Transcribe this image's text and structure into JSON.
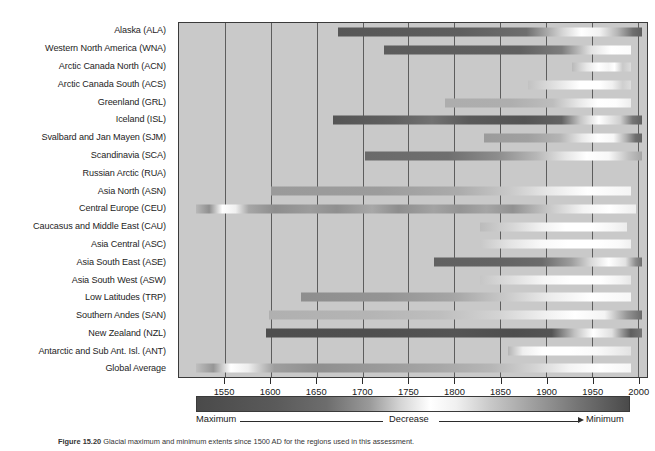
{
  "figure": {
    "caption_number": "Figure 15.20",
    "caption_text": "Glacial maximum and minimum extents since 1500 AD for the regions used in this assessment."
  },
  "axis": {
    "tick_labels": [
      "1550",
      "1600",
      "1650",
      "1700",
      "1750",
      "1800",
      "1850",
      "1900",
      "1950",
      "2000"
    ],
    "xlim_min": 1500,
    "xlim_max": 2010
  },
  "legend": {
    "left_label": "Maximum",
    "middle_label": "Decrease",
    "right_label": "Minimum",
    "color_dark": "#4a4a4a",
    "color_light": "#ffffff"
  },
  "chart_data": {
    "type": "heatmap",
    "title": "",
    "xlabel": "",
    "ylabel": "",
    "xlim": [
      1500,
      2010
    ],
    "grid": true,
    "legend_position": "below",
    "colormap_note": "dark = glacial maximum, white = decrease, dark = minimum",
    "categories": [
      "Alaska (ALA)",
      "Western North America (WNA)",
      "Arctic Canada North (ACN)",
      "Arctic Canada South (ACS)",
      "Greenland (GRL)",
      "Iceland (ISL)",
      "Svalbard and Jan Mayen (SJM)",
      "Scandinavia (SCA)",
      "Russian Arctic (RUA)",
      "Asia North (ASN)",
      "Central Europe (CEU)",
      "Caucasus and Middle East (CAU)",
      "Asia Central (ASC)",
      "Asia South East (ASE)",
      "Asia South West (ASW)",
      "Low Latitudes (TRP)",
      "Southern Andes (SAN)",
      "New Zealand (NZL)",
      "Antarctic and Sub Ant. Isl. (ANT)",
      "Global Average"
    ],
    "series": [
      {
        "region": "Alaska (ALA)",
        "start": 1673,
        "end": 2005,
        "stops": [
          [
            0,
            "#575757"
          ],
          [
            40,
            "#5e5e5e"
          ],
          [
            62,
            "#6e6e6e"
          ],
          [
            74,
            "#d6d6d6"
          ],
          [
            80,
            "#ffffff"
          ],
          [
            86,
            "#f2f2f2"
          ],
          [
            92,
            "#b5b5b5"
          ],
          [
            97,
            "#6f6f6f"
          ],
          [
            100,
            "#5e5e5e"
          ]
        ]
      },
      {
        "region": "Western North America (WNA)",
        "start": 1723,
        "end": 1993,
        "stops": [
          [
            0,
            "#5c5c5c"
          ],
          [
            55,
            "#606060"
          ],
          [
            72,
            "#7d7d7d"
          ],
          [
            84,
            "#e4e4e4"
          ],
          [
            92,
            "#ffffff"
          ],
          [
            100,
            "#fbfbfb"
          ]
        ]
      },
      {
        "region": "Arctic Canada North (ACN)",
        "start": 1928,
        "end": 1993,
        "stops": [
          [
            0,
            "#b9b9b9"
          ],
          [
            25,
            "#e8e8e8"
          ],
          [
            45,
            "#ffffff"
          ],
          [
            62,
            "#f4f4f4"
          ],
          [
            72,
            "#ffffff"
          ],
          [
            86,
            "#c9c9c9"
          ],
          [
            100,
            "#dcdcdc"
          ]
        ]
      },
      {
        "region": "Arctic Canada South (ACS)",
        "start": 1880,
        "end": 1993,
        "stops": [
          [
            0,
            "#c2c2c2"
          ],
          [
            30,
            "#e6e6e6"
          ],
          [
            50,
            "#ffffff"
          ],
          [
            70,
            "#ffffff"
          ],
          [
            82,
            "#f0f0f0"
          ],
          [
            92,
            "#cfcfcf"
          ],
          [
            100,
            "#dddddd"
          ]
        ]
      },
      {
        "region": "Greenland (GRL)",
        "start": 1790,
        "end": 1993,
        "stops": [
          [
            0,
            "#adadad"
          ],
          [
            35,
            "#aeaeae"
          ],
          [
            58,
            "#bdbdbd"
          ],
          [
            72,
            "#e8e8e8"
          ],
          [
            82,
            "#ffffff"
          ],
          [
            92,
            "#fdfdfd"
          ],
          [
            100,
            "#ededed"
          ]
        ]
      },
      {
        "region": "Iceland (ISL)",
        "start": 1668,
        "end": 2005,
        "stops": [
          [
            0,
            "#555555"
          ],
          [
            20,
            "#606060"
          ],
          [
            32,
            "#727272"
          ],
          [
            44,
            "#5a5a5a"
          ],
          [
            62,
            "#545454"
          ],
          [
            74,
            "#636363"
          ],
          [
            80,
            "#c5c5c5"
          ],
          [
            86,
            "#ffffff"
          ],
          [
            93,
            "#cfcfcf"
          ],
          [
            97,
            "#757575"
          ],
          [
            100,
            "#5f5f5f"
          ]
        ]
      },
      {
        "region": "Svalbard and Jan Mayen (SJM)",
        "start": 1832,
        "end": 2005,
        "stops": [
          [
            0,
            "#9b9b9b"
          ],
          [
            28,
            "#a0a0a0"
          ],
          [
            48,
            "#b4b4b4"
          ],
          [
            62,
            "#e9e9e9"
          ],
          [
            72,
            "#ffffff"
          ],
          [
            82,
            "#f7f7f7"
          ],
          [
            90,
            "#b0b0b0"
          ],
          [
            96,
            "#6e6e6e"
          ],
          [
            100,
            "#636363"
          ]
        ]
      },
      {
        "region": "Scandinavia (SCA)",
        "start": 1703,
        "end": 2005,
        "stops": [
          [
            0,
            "#6a6a6a"
          ],
          [
            30,
            "#6f6f6f"
          ],
          [
            48,
            "#8d8d8d"
          ],
          [
            62,
            "#b7b7b7"
          ],
          [
            72,
            "#e4e4e4"
          ],
          [
            80,
            "#ffffff"
          ],
          [
            88,
            "#f8f8f8"
          ],
          [
            95,
            "#c2c2c2"
          ],
          [
            100,
            "#a5a5a5"
          ]
        ]
      },
      {
        "region": "Russian Arctic (RUA)",
        "start": null,
        "end": null,
        "stops": []
      },
      {
        "region": "Asia North (ASN)",
        "start": 1600,
        "end": 1993,
        "stops": [
          [
            0,
            "#9a9a9a"
          ],
          [
            30,
            "#9c9c9c"
          ],
          [
            52,
            "#ababab"
          ],
          [
            66,
            "#c8c8c8"
          ],
          [
            78,
            "#eaeaea"
          ],
          [
            88,
            "#ffffff"
          ],
          [
            100,
            "#f4f4f4"
          ]
        ]
      },
      {
        "region": "Central Europe (CEU)",
        "start": 1519,
        "end": 1998,
        "stops": [
          [
            0,
            "#b8b8b8"
          ],
          [
            3,
            "#8f8f8f"
          ],
          [
            6,
            "#ffffff"
          ],
          [
            9,
            "#f0f0f0"
          ],
          [
            12,
            "#a6a6a6"
          ],
          [
            18,
            "#8d8d8d"
          ],
          [
            26,
            "#9c9c9c"
          ],
          [
            32,
            "#8f8f8f"
          ],
          [
            40,
            "#a8a8a8"
          ],
          [
            46,
            "#8d8d8d"
          ],
          [
            54,
            "#a3a3a3"
          ],
          [
            60,
            "#949494"
          ],
          [
            66,
            "#a5a5a5"
          ],
          [
            72,
            "#919191"
          ],
          [
            80,
            "#c6c6c6"
          ],
          [
            88,
            "#f4f4f4"
          ],
          [
            94,
            "#ffffff"
          ],
          [
            100,
            "#eeeeee"
          ]
        ]
      },
      {
        "region": "Caucasus and Middle East (CAU)",
        "start": 1828,
        "end": 1988,
        "stops": [
          [
            0,
            "#bbbbbb"
          ],
          [
            22,
            "#d6d6d6"
          ],
          [
            42,
            "#f2f2f2"
          ],
          [
            58,
            "#ffffff"
          ],
          [
            76,
            "#ffffff"
          ],
          [
            90,
            "#f6f6f6"
          ],
          [
            100,
            "#ececec"
          ]
        ]
      },
      {
        "region": "Asia Central (ASC)",
        "start": 1828,
        "end": 1993,
        "stops": [
          [
            0,
            "#c8c8c8"
          ],
          [
            20,
            "#e4e4e4"
          ],
          [
            40,
            "#f8f8f8"
          ],
          [
            58,
            "#ffffff"
          ],
          [
            78,
            "#ffffff"
          ],
          [
            92,
            "#fafafa"
          ],
          [
            100,
            "#f0f0f0"
          ]
        ]
      },
      {
        "region": "Asia South East (ASE)",
        "start": 1778,
        "end": 2005,
        "stops": [
          [
            0,
            "#616161"
          ],
          [
            30,
            "#636363"
          ],
          [
            52,
            "#6b6b6b"
          ],
          [
            66,
            "#9d9d9d"
          ],
          [
            76,
            "#dcdcdc"
          ],
          [
            84,
            "#ffffff"
          ],
          [
            92,
            "#e2e2e2"
          ],
          [
            97,
            "#8b8b8b"
          ],
          [
            100,
            "#6e6e6e"
          ]
        ]
      },
      {
        "region": "Asia South West (ASW)",
        "start": 1828,
        "end": 1993,
        "stops": [
          [
            0,
            "#c6c6c6"
          ],
          [
            22,
            "#dfdfdf"
          ],
          [
            42,
            "#f6f6f6"
          ],
          [
            60,
            "#ffffff"
          ],
          [
            80,
            "#ffffff"
          ],
          [
            93,
            "#f2f2f2"
          ],
          [
            100,
            "#e6e6e6"
          ]
        ]
      },
      {
        "region": "Low Latitudes (TRP)",
        "start": 1633,
        "end": 1993,
        "stops": [
          [
            0,
            "#8e8e8e"
          ],
          [
            26,
            "#949494"
          ],
          [
            46,
            "#a5a5a5"
          ],
          [
            62,
            "#c9c9c9"
          ],
          [
            76,
            "#ededed"
          ],
          [
            88,
            "#ffffff"
          ],
          [
            100,
            "#f7f7f7"
          ]
        ]
      },
      {
        "region": "Southern Andes (SAN)",
        "start": 1598,
        "end": 2005,
        "stops": [
          [
            0,
            "#b0b0b0"
          ],
          [
            26,
            "#b4b4b4"
          ],
          [
            46,
            "#bebebe"
          ],
          [
            62,
            "#d4d4d4"
          ],
          [
            74,
            "#f0f0f0"
          ],
          [
            82,
            "#ffffff"
          ],
          [
            90,
            "#f4f4f4"
          ],
          [
            96,
            "#959595"
          ],
          [
            100,
            "#6a6a6a"
          ]
        ]
      },
      {
        "region": "New Zealand (NZL)",
        "start": 1595,
        "end": 2005,
        "stops": [
          [
            0,
            "#4e4e4e"
          ],
          [
            28,
            "#4f4f4f"
          ],
          [
            50,
            "#545454"
          ],
          [
            66,
            "#4e4e4e"
          ],
          [
            76,
            "#545454"
          ],
          [
            82,
            "#c0c0c0"
          ],
          [
            87,
            "#ffffff"
          ],
          [
            92,
            "#e0e0e0"
          ],
          [
            95,
            "#909090"
          ],
          [
            97,
            "#5f5f5f"
          ],
          [
            100,
            "#757575"
          ]
        ]
      },
      {
        "region": "Antarctic and Sub Ant. Isl. (ANT)",
        "start": 1858,
        "end": 1993,
        "stops": [
          [
            0,
            "#b4b4b4"
          ],
          [
            12,
            "#efefef"
          ],
          [
            28,
            "#ffffff"
          ],
          [
            50,
            "#ffffff"
          ],
          [
            72,
            "#fafafa"
          ],
          [
            88,
            "#ededed"
          ],
          [
            100,
            "#e2e2e2"
          ]
        ]
      },
      {
        "region": "Global Average",
        "start": 1519,
        "end": 1993,
        "stops": [
          [
            0,
            "#bfbfbf"
          ],
          [
            4,
            "#969696"
          ],
          [
            8,
            "#ffffff"
          ],
          [
            12,
            "#eeeeee"
          ],
          [
            18,
            "#9e9e9e"
          ],
          [
            28,
            "#8f8f8f"
          ],
          [
            42,
            "#9a9a9a"
          ],
          [
            56,
            "#a7a7a7"
          ],
          [
            68,
            "#b6b6b6"
          ],
          [
            78,
            "#d4d4d4"
          ],
          [
            86,
            "#f4f4f4"
          ],
          [
            93,
            "#ffffff"
          ],
          [
            100,
            "#f6f6f6"
          ]
        ]
      }
    ]
  }
}
